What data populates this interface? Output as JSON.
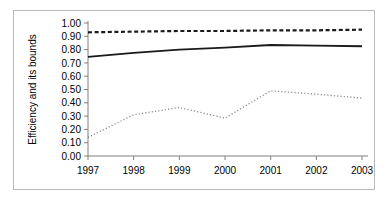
{
  "chart_data": {
    "type": "line",
    "title": "",
    "xlabel": "",
    "ylabel": "Efficiency and its bounds",
    "x": [
      1997,
      1998,
      1999,
      2000,
      2001,
      2002,
      2003
    ],
    "categories": [
      "1997",
      "1998",
      "1999",
      "2000",
      "2001",
      "2002",
      "2003"
    ],
    "xtick_labels": [
      "1997",
      "1998",
      "1999",
      "2000",
      "2001",
      "2002",
      "2003"
    ],
    "ytick_labels": [
      "0.00",
      "0.10",
      "0.20",
      "0.30",
      "0.40",
      "0.50",
      "0.60",
      "0.70",
      "0.80",
      "0.90",
      "1.00"
    ],
    "ytick_values": [
      0.0,
      0.1,
      0.2,
      0.3,
      0.4,
      0.5,
      0.6,
      0.7,
      0.8,
      0.9,
      1.0
    ],
    "ylim": [
      0.0,
      1.0
    ],
    "xlim": [
      1997,
      2003
    ],
    "grid": false,
    "legend": "none",
    "series": [
      {
        "name": "Upper bound",
        "style": "dashed",
        "color": "#1a1a1a",
        "values": [
          0.93,
          0.935,
          0.94,
          0.94,
          0.945,
          0.945,
          0.95
        ]
      },
      {
        "name": "Efficiency",
        "style": "solid",
        "color": "#1a1a1a",
        "values": [
          0.745,
          0.775,
          0.8,
          0.815,
          0.835,
          0.83,
          0.825
        ]
      },
      {
        "name": "Lower bound",
        "style": "dotted",
        "color": "#808080",
        "values": [
          0.14,
          0.31,
          0.365,
          0.285,
          0.49,
          0.465,
          0.435
        ]
      }
    ]
  },
  "axis": {
    "y_title": "Efficiency and its bounds"
  }
}
